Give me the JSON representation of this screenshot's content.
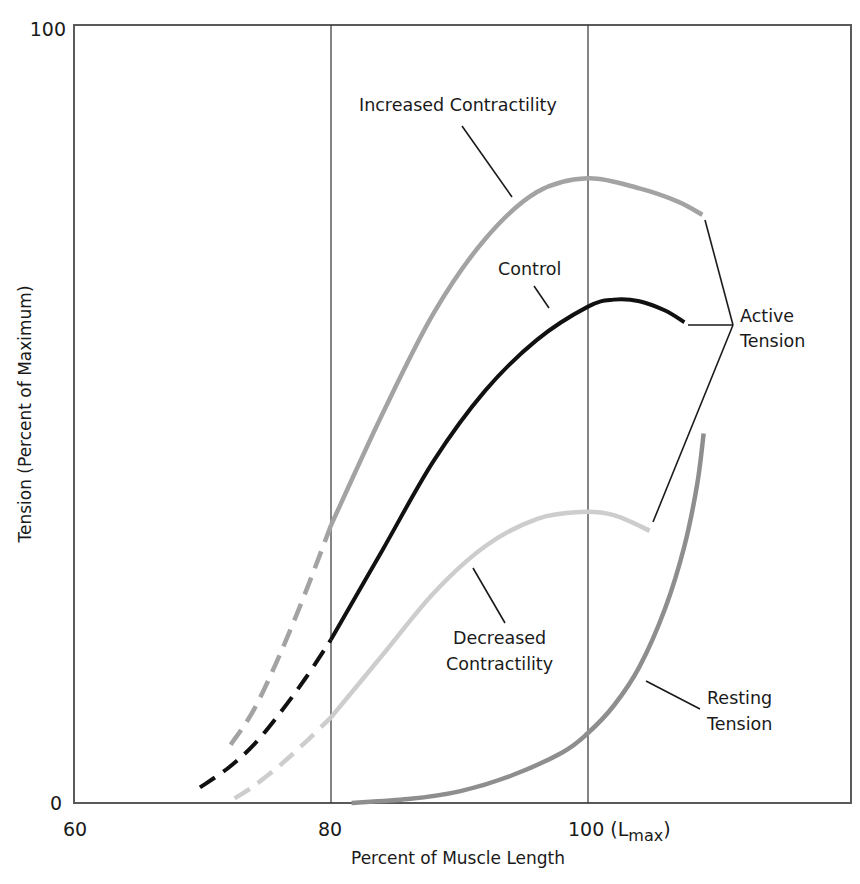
{
  "chart_data": {
    "type": "line",
    "title": "",
    "xlabel": "Percent of Muscle Length",
    "ylabel": "Tension (Percent of Maximum)",
    "xlim": [
      60,
      120.5
    ],
    "ylim": [
      0,
      100
    ],
    "x_ticks": [
      {
        "value": 60,
        "label": "60"
      },
      {
        "value": 80,
        "label": "80"
      },
      {
        "value": 100,
        "label": "100 (L",
        "sub": "max",
        "suffix": ")"
      }
    ],
    "y_ticks": [
      {
        "value": 0,
        "label": "0"
      },
      {
        "value": 100,
        "label": "100"
      }
    ],
    "vertical_gridlines": [
      80,
      100
    ],
    "grid": false,
    "legend": "none (direct curve labels)",
    "series": [
      {
        "name": "Increased Contractility",
        "group": "Active Tension",
        "color": "#a3a3a3",
        "dashed_until_x": 80,
        "points": [
          [
            72.2,
            7.5
          ],
          [
            74,
            12
          ],
          [
            76,
            19
          ],
          [
            78,
            27
          ],
          [
            80,
            35.7
          ],
          [
            84,
            50
          ],
          [
            88,
            63
          ],
          [
            92,
            72.5
          ],
          [
            96,
            78.5
          ],
          [
            100,
            80.3
          ],
          [
            104,
            79
          ],
          [
            107,
            77.3
          ],
          [
            108.9,
            75.6
          ]
        ]
      },
      {
        "name": "Control",
        "group": "Active Tension",
        "color": "#111111",
        "dashed_until_x": 80,
        "points": [
          [
            69.8,
            2
          ],
          [
            72,
            4.5
          ],
          [
            74,
            7.5
          ],
          [
            76,
            11.5
          ],
          [
            78,
            16
          ],
          [
            80,
            21
          ],
          [
            84,
            32.5
          ],
          [
            88,
            44
          ],
          [
            92,
            53
          ],
          [
            96,
            59.5
          ],
          [
            100,
            63.8
          ],
          [
            102,
            64.7
          ],
          [
            104,
            64.5
          ],
          [
            106,
            63.3
          ],
          [
            107.5,
            61.8
          ]
        ]
      },
      {
        "name": "Decreased Contractility",
        "group": "Active Tension",
        "color": "#cdcdcd",
        "dashed_until_x": 80,
        "points": [
          [
            72.5,
            0.6
          ],
          [
            74,
            2.2
          ],
          [
            76,
            4.8
          ],
          [
            78,
            7.8
          ],
          [
            80,
            11
          ],
          [
            84,
            19
          ],
          [
            88,
            27
          ],
          [
            92,
            33
          ],
          [
            96,
            36.5
          ],
          [
            99.4,
            37.4
          ],
          [
            102,
            37
          ],
          [
            104.8,
            35
          ]
        ]
      },
      {
        "name": "Resting Tension",
        "color": "#8e8e8e",
        "dashed_until_x": null,
        "points": [
          [
            81.6,
            0
          ],
          [
            86,
            0.5
          ],
          [
            90,
            1.5
          ],
          [
            94,
            3.5
          ],
          [
            98,
            6.5
          ],
          [
            100,
            9
          ],
          [
            102,
            12.5
          ],
          [
            104,
            17.5
          ],
          [
            106,
            25
          ],
          [
            107.5,
            33
          ],
          [
            108.5,
            41
          ],
          [
            109,
            47.5
          ]
        ]
      }
    ],
    "annotations": [
      {
        "text": "Increased Contractility",
        "target": "Increased Contractility"
      },
      {
        "text": "Control",
        "target": "Control"
      },
      {
        "text": "Decreased Contractility",
        "target": "Decreased Contractility"
      },
      {
        "text": "Resting Tension",
        "target": "Resting Tension"
      },
      {
        "text": "Active Tension",
        "targets": [
          "Increased Contractility",
          "Control",
          "Decreased Contractility"
        ]
      }
    ]
  },
  "labels": {
    "y_tick_0": "0",
    "y_tick_100": "100",
    "x_tick_60": "60",
    "x_tick_80": "80",
    "x_tick_100_main": "100 (L",
    "x_tick_100_sub": "max",
    "x_tick_100_close": ")",
    "x_axis_title": "Percent of Muscle Length",
    "y_axis_title": "Tension (Percent of Maximum)",
    "increased": "Increased Contractility",
    "control": "Control",
    "decreased_line1": "Decreased",
    "decreased_line2": "Contractility",
    "resting_line1": "Resting",
    "resting_line2": "Tension",
    "active_line1": "Active",
    "active_line2": "Tension"
  }
}
